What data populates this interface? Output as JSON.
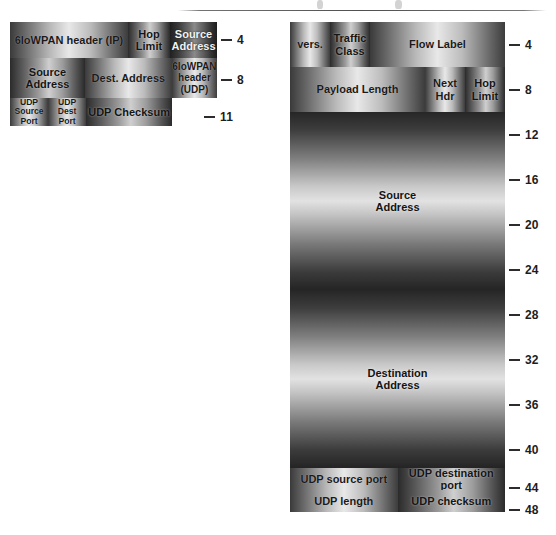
{
  "figure": {
    "type": "packet-format-diagram",
    "panels": [
      {
        "id": "left",
        "name": "6loWPAN compressed header",
        "rows": [
          {
            "fields": [
              {
                "label": "6loWPAN header (IP)",
                "width_pct": 57.0,
                "shade": "light"
              },
              {
                "label": "Hop\nLimit",
                "width_pct": 20.3,
                "shade": "mid"
              },
              {
                "label": "Source\nAddress",
                "width_pct": 22.7,
                "shade": "dark"
              }
            ]
          },
          {
            "fields": [
              {
                "label": "Source\nAddress",
                "width_pct": 36.2,
                "shade": "mid"
              },
              {
                "label": "Dest. Address",
                "width_pct": 42.0,
                "shade": "light"
              },
              {
                "label": "6loWPAN\nheader\n(UDP)",
                "width_pct": 21.8,
                "shade": "light"
              }
            ]
          },
          {
            "fields": [
              {
                "label": "UDP\nSource Port",
                "width_pct": 18.4,
                "shade": "light"
              },
              {
                "label": "UDP\nDest Port",
                "width_pct": 18.4,
                "shade": "light"
              },
              {
                "label": "UDP Checksum",
                "width_pct": 41.5,
                "shade": "mid"
              }
            ]
          }
        ],
        "ticks": [
          {
            "value": "4",
            "row": 0
          },
          {
            "value": "8",
            "row": 1
          },
          {
            "value": "11",
            "row": 2
          }
        ]
      },
      {
        "id": "right",
        "name": "Uncompressed IPv6 and UDP header",
        "rows": [
          {
            "fields": [
              {
                "label": "vers.",
                "width_pct": 18.6,
                "shade": "light"
              },
              {
                "label": "Traffic\nClass",
                "width_pct": 18.6,
                "shade": "mid"
              },
              {
                "label": "Flow Label",
                "width_pct": 62.8,
                "shade": "light"
              }
            ]
          },
          {
            "fields": [
              {
                "label": "Payload Length",
                "width_pct": 62.8,
                "shade": "light"
              },
              {
                "label": "Next\nHdr",
                "width_pct": 18.6,
                "shade": "light"
              },
              {
                "label": "Hop\nLimit",
                "width_pct": 18.6,
                "shade": "mid"
              }
            ]
          },
          {
            "fields": [
              {
                "label": "Source\nAddress",
                "width_pct": 100,
                "shade": "vertical"
              }
            ]
          },
          {
            "fields": [
              {
                "label": "Destination\nAddress",
                "width_pct": 100,
                "shade": "vertical"
              }
            ]
          },
          {
            "fields": [
              {
                "label": "UDP source port",
                "width_pct": 50,
                "shade": "light"
              },
              {
                "label": "UDP destination port",
                "width_pct": 50,
                "shade": "mid"
              }
            ]
          },
          {
            "fields": [
              {
                "label": "UDP length",
                "width_pct": 50,
                "shade": "light"
              },
              {
                "label": "UDP checksum",
                "width_pct": 50,
                "shade": "mid"
              }
            ]
          }
        ],
        "ticks": [
          {
            "value": "4"
          },
          {
            "value": "8"
          },
          {
            "value": "12"
          },
          {
            "value": "16"
          },
          {
            "value": "20"
          },
          {
            "value": "24"
          },
          {
            "value": "28"
          },
          {
            "value": "32"
          },
          {
            "value": "36"
          },
          {
            "value": "40"
          },
          {
            "value": "44"
          },
          {
            "value": "48"
          }
        ]
      }
    ],
    "colors": {
      "tick": "#2c2c2c",
      "text_dark": "#1a1a1a",
      "text_light": "#f2f2f2",
      "background": "#ffffff"
    }
  }
}
